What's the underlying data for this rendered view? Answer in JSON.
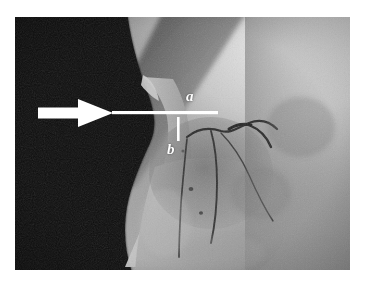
{
  "figure": {
    "kind": "grayscale-anatomical-photograph",
    "caption_labels": {
      "label_a": "a",
      "label_b": "b"
    },
    "annotations": [
      {
        "name": "pointer-arrow",
        "shape": "arrow",
        "direction": "right",
        "color": "#ffffff",
        "tail_x": 38,
        "tip_x": 113,
        "y": 113
      },
      {
        "name": "measure-line-a",
        "shape": "horizontal-line",
        "color": "#ffffff",
        "x1": 113,
        "x2": 218,
        "y": 113,
        "label": "a"
      },
      {
        "name": "measure-tick-b",
        "shape": "vertical-line",
        "color": "#ffffff",
        "x": 178,
        "y1": 118,
        "y2": 140,
        "label": "b"
      }
    ],
    "plate": {
      "x": 15,
      "y": 17,
      "width": 335,
      "height": 253
    },
    "palette": {
      "page_background": "#ffffff",
      "shadow_black": "#0b0b0b",
      "dark_tissue": "#1a1a1a",
      "mid_gray": "#8e8e8e",
      "light_gray": "#b9b9b9",
      "highlight_gray": "#e3e3e3",
      "annotation_white": "#ffffff",
      "fissure_dark": "#232323"
    }
  }
}
